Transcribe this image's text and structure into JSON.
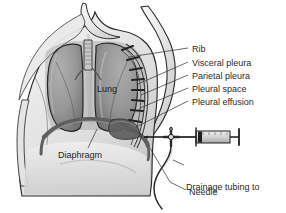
{
  "figure": {
    "type": "medical-illustration",
    "palette": {
      "background": "#ffffff",
      "skin_light": "#f2f2f2",
      "skin_mid": "#dcdcdc",
      "skin_shadow": "#bdbdbd",
      "lung_fill": "#9b9b9b",
      "lung_dark": "#7d7d7d",
      "outline": "#2a2a2a",
      "diaphragm": "#6e6e6e",
      "effusion": "#5f5f5f",
      "syringe_body": "#d9d9d9",
      "syringe_outline": "#262626",
      "text": "#2b2b2b",
      "leader_line": "#3a3a3a"
    }
  },
  "labels": {
    "inner": [
      {
        "id": "lung",
        "text": "Lung",
        "x": 97,
        "y": 84
      },
      {
        "id": "diaphragm",
        "text": "Diaphragm",
        "x": 58,
        "y": 150
      }
    ],
    "right_stack": [
      {
        "id": "rib",
        "text": "Rib",
        "x": 192,
        "y": 44
      },
      {
        "id": "visceral-pleura",
        "text": "Visceral pleura",
        "x": 192,
        "y": 58
      },
      {
        "id": "parietal-pleura",
        "text": "Parietal pleura",
        "x": 192,
        "y": 71
      },
      {
        "id": "pleural-space",
        "text": "Pleural space",
        "x": 192,
        "y": 84
      },
      {
        "id": "pleural-effusion",
        "text": "Pleural effusion",
        "x": 192,
        "y": 97
      }
    ],
    "lower_stack": [
      {
        "id": "drainage-tubing",
        "line1": "Drainage tubing to",
        "line2": "large receptacle",
        "x": 186,
        "y": 160
      },
      {
        "id": "needle",
        "text": "Needle",
        "x": 189,
        "y": 187
      }
    ]
  },
  "anatomy": {
    "structures": [
      "torso",
      "neck",
      "left-shoulder",
      "right-shoulder",
      "right-arm",
      "trachea",
      "left-lung",
      "right-lung",
      "diaphragm",
      "rib-cage-cross-section",
      "visceral-pleura-layer",
      "parietal-pleura-layer",
      "pleural-space",
      "pleural-effusion-fluid"
    ],
    "rib_count": 9
  },
  "equipment": {
    "items": [
      "needle",
      "three-way-stopcock",
      "syringe-barrel",
      "syringe-plunger",
      "drainage-tubing"
    ],
    "syringe": {
      "x": 196,
      "y": 132,
      "w": 44,
      "h": 11
    },
    "stopcock": {
      "x": 171,
      "y": 137
    },
    "needle_tip": {
      "x": 150,
      "y": 137
    }
  }
}
